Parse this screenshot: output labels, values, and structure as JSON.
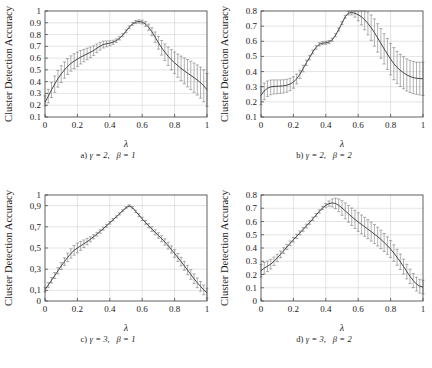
{
  "figure": {
    "axis_title_y": "Cluster Detection Accuracy",
    "axis_title_x": "λ"
  },
  "chart_data": [
    {
      "id": "a",
      "type": "line",
      "title": "a) γ = 2,  β = 1",
      "caption_prefix": "a)",
      "caption_gamma": "γ = 2,",
      "caption_beta": "β = 1",
      "xlabel": "λ",
      "ylabel": "Cluster Detection Accuracy",
      "xlim": [
        0,
        1
      ],
      "ylim": [
        0.1,
        1
      ],
      "xticks": [
        0,
        0.2,
        0.4,
        0.6,
        0.8,
        1
      ],
      "xticklabels": [
        "0",
        "0.2",
        "0.4",
        "0.6",
        "0.8",
        "1"
      ],
      "yticks": [
        0.1,
        0.2,
        0.3,
        0.4,
        0.5,
        0.6,
        0.7,
        0.8,
        0.9,
        1
      ],
      "yticklabels": [
        "0.1",
        "0.2",
        "0.3",
        "0.4",
        "0.5",
        "0.6",
        "0.7",
        "0.8",
        "0.9",
        "1"
      ],
      "grid": true,
      "legend": "none",
      "x": [
        0.0,
        0.02,
        0.04,
        0.06,
        0.08,
        0.1,
        0.12,
        0.14,
        0.16,
        0.18,
        0.2,
        0.22,
        0.24,
        0.26,
        0.28,
        0.3,
        0.32,
        0.34,
        0.36,
        0.38,
        0.4,
        0.42,
        0.44,
        0.46,
        0.48,
        0.5,
        0.52,
        0.54,
        0.56,
        0.58,
        0.6,
        0.62,
        0.64,
        0.66,
        0.68,
        0.7,
        0.72,
        0.74,
        0.76,
        0.78,
        0.8,
        0.82,
        0.84,
        0.86,
        0.88,
        0.9,
        0.92,
        0.94,
        0.96,
        0.98,
        1.0
      ],
      "y": [
        0.225,
        0.275,
        0.33,
        0.38,
        0.425,
        0.465,
        0.5,
        0.53,
        0.555,
        0.575,
        0.592,
        0.608,
        0.622,
        0.636,
        0.65,
        0.665,
        0.684,
        0.702,
        0.716,
        0.722,
        0.727,
        0.735,
        0.748,
        0.768,
        0.795,
        0.828,
        0.862,
        0.89,
        0.906,
        0.911,
        0.906,
        0.89,
        0.862,
        0.824,
        0.778,
        0.73,
        0.688,
        0.65,
        0.616,
        0.586,
        0.56,
        0.536,
        0.513,
        0.492,
        0.472,
        0.453,
        0.434,
        0.414,
        0.392,
        0.365,
        0.33
      ],
      "yerr_low": [
        0.03,
        0.055,
        0.065,
        0.07,
        0.072,
        0.072,
        0.07,
        0.068,
        0.066,
        0.064,
        0.062,
        0.058,
        0.054,
        0.05,
        0.046,
        0.042,
        0.038,
        0.034,
        0.03,
        0.026,
        0.022,
        0.018,
        0.016,
        0.014,
        0.013,
        0.012,
        0.012,
        0.012,
        0.013,
        0.014,
        0.016,
        0.02,
        0.026,
        0.034,
        0.044,
        0.054,
        0.062,
        0.07,
        0.078,
        0.086,
        0.092,
        0.098,
        0.104,
        0.11,
        0.116,
        0.12,
        0.124,
        0.128,
        0.132,
        0.136,
        0.14
      ],
      "yerr_high": [
        0.055,
        0.06,
        0.065,
        0.068,
        0.07,
        0.07,
        0.068,
        0.066,
        0.064,
        0.062,
        0.06,
        0.056,
        0.052,
        0.048,
        0.044,
        0.04,
        0.036,
        0.032,
        0.028,
        0.024,
        0.02,
        0.017,
        0.015,
        0.014,
        0.013,
        0.012,
        0.012,
        0.012,
        0.013,
        0.014,
        0.016,
        0.02,
        0.026,
        0.034,
        0.044,
        0.054,
        0.062,
        0.07,
        0.078,
        0.086,
        0.092,
        0.098,
        0.104,
        0.11,
        0.116,
        0.12,
        0.124,
        0.128,
        0.132,
        0.136,
        0.14
      ]
    },
    {
      "id": "b",
      "type": "line",
      "title": "b) γ = 2,  β = 2",
      "caption_prefix": "b)",
      "caption_gamma": "γ = 2,",
      "caption_beta": "β = 2",
      "xlabel": "λ",
      "ylabel": "Cluster Detection Accuracy",
      "xlim": [
        0,
        1
      ],
      "ylim": [
        0.1,
        0.8
      ],
      "xticks": [
        0,
        0.2,
        0.4,
        0.6,
        0.8,
        1
      ],
      "xticklabels": [
        "0",
        "0.2",
        "0.4",
        "0.6",
        "0.8",
        "1"
      ],
      "yticks": [
        0.1,
        0.2,
        0.3,
        0.4,
        0.5,
        0.6,
        0.7,
        0.8
      ],
      "yticklabels": [
        "0.1",
        "0.2",
        "0.3",
        "0.4",
        "0.5",
        "0.6",
        "0.7",
        "0.8"
      ],
      "grid": true,
      "legend": "none",
      "x": [
        0.0,
        0.02,
        0.04,
        0.06,
        0.08,
        0.1,
        0.12,
        0.14,
        0.16,
        0.18,
        0.2,
        0.22,
        0.24,
        0.26,
        0.28,
        0.3,
        0.32,
        0.34,
        0.36,
        0.38,
        0.4,
        0.42,
        0.44,
        0.46,
        0.48,
        0.5,
        0.52,
        0.54,
        0.56,
        0.58,
        0.6,
        0.62,
        0.64,
        0.66,
        0.68,
        0.7,
        0.72,
        0.74,
        0.76,
        0.78,
        0.8,
        0.82,
        0.84,
        0.86,
        0.88,
        0.9,
        0.92,
        0.94,
        0.96,
        0.98,
        1.0
      ],
      "y": [
        0.243,
        0.272,
        0.29,
        0.299,
        0.302,
        0.303,
        0.304,
        0.306,
        0.31,
        0.318,
        0.33,
        0.352,
        0.382,
        0.42,
        0.458,
        0.492,
        0.53,
        0.56,
        0.58,
        0.588,
        0.59,
        0.595,
        0.61,
        0.64,
        0.678,
        0.72,
        0.762,
        0.786,
        0.79,
        0.785,
        0.775,
        0.762,
        0.742,
        0.718,
        0.69,
        0.658,
        0.622,
        0.586,
        0.55,
        0.516,
        0.482,
        0.452,
        0.428,
        0.408,
        0.392,
        0.378,
        0.368,
        0.36,
        0.356,
        0.354,
        0.352
      ],
      "yerr_low": [
        0.062,
        0.058,
        0.054,
        0.052,
        0.05,
        0.049,
        0.048,
        0.047,
        0.046,
        0.044,
        0.04,
        0.034,
        0.028,
        0.022,
        0.018,
        0.015,
        0.013,
        0.012,
        0.011,
        0.01,
        0.01,
        0.01,
        0.01,
        0.01,
        0.01,
        0.01,
        0.01,
        0.012,
        0.016,
        0.026,
        0.04,
        0.054,
        0.066,
        0.076,
        0.084,
        0.09,
        0.094,
        0.098,
        0.1,
        0.102,
        0.104,
        0.106,
        0.106,
        0.106,
        0.106,
        0.106,
        0.106,
        0.106,
        0.106,
        0.108,
        0.11
      ],
      "yerr_high": [
        0.058,
        0.052,
        0.048,
        0.045,
        0.043,
        0.042,
        0.041,
        0.04,
        0.039,
        0.038,
        0.036,
        0.032,
        0.027,
        0.022,
        0.018,
        0.015,
        0.013,
        0.012,
        0.011,
        0.01,
        0.01,
        0.01,
        0.01,
        0.01,
        0.01,
        0.01,
        0.01,
        0.012,
        0.016,
        0.026,
        0.04,
        0.054,
        0.066,
        0.076,
        0.084,
        0.09,
        0.094,
        0.098,
        0.1,
        0.102,
        0.104,
        0.106,
        0.106,
        0.106,
        0.106,
        0.106,
        0.106,
        0.106,
        0.106,
        0.108,
        0.11
      ]
    },
    {
      "id": "c",
      "type": "line",
      "title": "c) γ = 3,  β = 1",
      "caption_prefix": "c)",
      "caption_gamma": "γ = 3,",
      "caption_beta": "β = 1",
      "xlabel": "λ",
      "ylabel": "Cluster Detection Accuracy",
      "xlim": [
        0,
        1
      ],
      "ylim": [
        0,
        1
      ],
      "xticks": [
        0,
        0.2,
        0.4,
        0.6,
        0.8,
        1
      ],
      "xticklabels": [
        "0",
        "0.2",
        "0.4",
        "0.6",
        "0.8",
        "1"
      ],
      "yticks": [
        0,
        0.1,
        0.3,
        0.5,
        0.7,
        0.9,
        1
      ],
      "yticklabels": [
        "0",
        "0,1",
        "0,3",
        "0,5",
        "0,7",
        "0,9",
        "1"
      ],
      "grid": true,
      "legend": "none",
      "x": [
        0.0,
        0.02,
        0.04,
        0.06,
        0.08,
        0.1,
        0.12,
        0.14,
        0.16,
        0.18,
        0.2,
        0.22,
        0.24,
        0.26,
        0.28,
        0.3,
        0.32,
        0.34,
        0.36,
        0.38,
        0.4,
        0.42,
        0.44,
        0.46,
        0.48,
        0.5,
        0.52,
        0.54,
        0.56,
        0.58,
        0.6,
        0.62,
        0.64,
        0.66,
        0.68,
        0.7,
        0.72,
        0.74,
        0.76,
        0.78,
        0.8,
        0.82,
        0.84,
        0.86,
        0.88,
        0.9,
        0.92,
        0.94,
        0.96,
        0.98,
        1.0
      ],
      "y": [
        0.108,
        0.15,
        0.195,
        0.24,
        0.285,
        0.33,
        0.372,
        0.412,
        0.448,
        0.478,
        0.5,
        0.52,
        0.54,
        0.56,
        0.582,
        0.606,
        0.63,
        0.656,
        0.682,
        0.71,
        0.738,
        0.766,
        0.794,
        0.822,
        0.852,
        0.88,
        0.898,
        0.88,
        0.845,
        0.81,
        0.775,
        0.742,
        0.71,
        0.678,
        0.648,
        0.618,
        0.588,
        0.556,
        0.522,
        0.486,
        0.448,
        0.41,
        0.372,
        0.332,
        0.292,
        0.25,
        0.21,
        0.172,
        0.138,
        0.105,
        0.075
      ],
      "yerr_low": [
        0.022,
        0.024,
        0.026,
        0.028,
        0.03,
        0.032,
        0.036,
        0.04,
        0.044,
        0.046,
        0.046,
        0.042,
        0.036,
        0.03,
        0.024,
        0.02,
        0.018,
        0.016,
        0.014,
        0.013,
        0.012,
        0.011,
        0.01,
        0.01,
        0.009,
        0.009,
        0.009,
        0.01,
        0.012,
        0.014,
        0.016,
        0.018,
        0.02,
        0.022,
        0.024,
        0.026,
        0.028,
        0.03,
        0.032,
        0.034,
        0.036,
        0.038,
        0.04,
        0.042,
        0.044,
        0.045,
        0.046,
        0.046,
        0.046,
        0.046,
        0.046
      ],
      "yerr_high": [
        0.022,
        0.024,
        0.026,
        0.028,
        0.03,
        0.032,
        0.036,
        0.04,
        0.044,
        0.046,
        0.046,
        0.042,
        0.036,
        0.03,
        0.024,
        0.02,
        0.018,
        0.016,
        0.014,
        0.013,
        0.012,
        0.011,
        0.01,
        0.01,
        0.009,
        0.009,
        0.009,
        0.01,
        0.012,
        0.014,
        0.016,
        0.018,
        0.02,
        0.022,
        0.024,
        0.026,
        0.028,
        0.03,
        0.032,
        0.034,
        0.036,
        0.038,
        0.04,
        0.042,
        0.044,
        0.045,
        0.046,
        0.046,
        0.046,
        0.046,
        0.046
      ]
    },
    {
      "id": "d",
      "type": "line",
      "title": "d) γ = 3,  β = 2",
      "caption_prefix": "d)",
      "caption_gamma": "γ = 3,",
      "caption_beta": "β = 2",
      "xlabel": "λ",
      "ylabel": "Cluster Detection Accuracy",
      "xlim": [
        0,
        1
      ],
      "ylim": [
        0,
        0.8
      ],
      "xticks": [
        0,
        0.2,
        0.4,
        0.6,
        0.8,
        1
      ],
      "xticklabels": [
        "0",
        "0.2",
        "0.4",
        "0.6",
        "0.8",
        "1"
      ],
      "yticks": [
        0,
        0.1,
        0.2,
        0.3,
        0.4,
        0.5,
        0.6,
        0.7,
        0.8
      ],
      "yticklabels": [
        "0",
        "0.1",
        "0.2",
        "0.3",
        "0.4",
        "0.5",
        "0.6",
        "0.7",
        "0.8"
      ],
      "grid": true,
      "legend": "none",
      "x": [
        0.0,
        0.02,
        0.04,
        0.06,
        0.08,
        0.1,
        0.12,
        0.14,
        0.16,
        0.18,
        0.2,
        0.22,
        0.24,
        0.26,
        0.28,
        0.3,
        0.32,
        0.34,
        0.36,
        0.38,
        0.4,
        0.42,
        0.44,
        0.46,
        0.48,
        0.5,
        0.52,
        0.54,
        0.56,
        0.58,
        0.6,
        0.62,
        0.64,
        0.66,
        0.68,
        0.7,
        0.72,
        0.74,
        0.76,
        0.78,
        0.8,
        0.82,
        0.84,
        0.86,
        0.88,
        0.9,
        0.92,
        0.94,
        0.96,
        0.98,
        1.0
      ],
      "y": [
        0.228,
        0.248,
        0.262,
        0.278,
        0.3,
        0.325,
        0.352,
        0.38,
        0.408,
        0.435,
        0.462,
        0.488,
        0.514,
        0.54,
        0.566,
        0.592,
        0.62,
        0.648,
        0.676,
        0.702,
        0.722,
        0.735,
        0.74,
        0.736,
        0.722,
        0.702,
        0.68,
        0.658,
        0.636,
        0.616,
        0.596,
        0.578,
        0.56,
        0.542,
        0.524,
        0.505,
        0.486,
        0.465,
        0.442,
        0.418,
        0.392,
        0.362,
        0.33,
        0.296,
        0.26,
        0.222,
        0.186,
        0.154,
        0.128,
        0.112,
        0.105
      ],
      "yerr_low": [
        0.048,
        0.044,
        0.04,
        0.036,
        0.032,
        0.028,
        0.025,
        0.022,
        0.02,
        0.018,
        0.017,
        0.016,
        0.015,
        0.014,
        0.014,
        0.013,
        0.013,
        0.012,
        0.012,
        0.012,
        0.014,
        0.02,
        0.03,
        0.04,
        0.048,
        0.055,
        0.06,
        0.063,
        0.066,
        0.068,
        0.07,
        0.071,
        0.072,
        0.072,
        0.072,
        0.072,
        0.071,
        0.07,
        0.068,
        0.066,
        0.064,
        0.062,
        0.06,
        0.058,
        0.056,
        0.055,
        0.054,
        0.053,
        0.052,
        0.052,
        0.052
      ],
      "yerr_high": [
        0.048,
        0.044,
        0.04,
        0.036,
        0.032,
        0.028,
        0.025,
        0.022,
        0.02,
        0.018,
        0.017,
        0.016,
        0.015,
        0.014,
        0.014,
        0.013,
        0.013,
        0.012,
        0.012,
        0.012,
        0.014,
        0.02,
        0.03,
        0.04,
        0.048,
        0.055,
        0.06,
        0.063,
        0.066,
        0.068,
        0.07,
        0.071,
        0.072,
        0.072,
        0.072,
        0.072,
        0.071,
        0.07,
        0.068,
        0.066,
        0.064,
        0.062,
        0.06,
        0.058,
        0.056,
        0.055,
        0.054,
        0.053,
        0.052,
        0.052,
        0.052
      ]
    }
  ]
}
